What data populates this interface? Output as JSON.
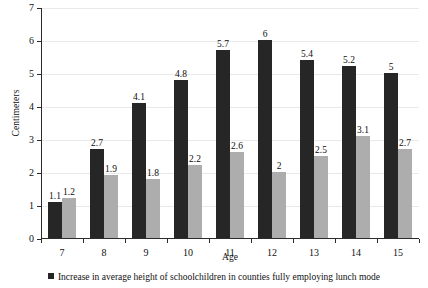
{
  "chart_data": {
    "type": "bar",
    "title": "",
    "subtitle": "",
    "xlabel": "Age",
    "ylabel": "Centimeters",
    "categories": [
      "7",
      "8",
      "9",
      "10",
      "11",
      "12",
      "13",
      "14",
      "15"
    ],
    "series": [
      {
        "name": "Increase in average height of schoolchildren in counties fully employing lunch mode",
        "color": "#262626",
        "values": [
          1.1,
          2.7,
          4.1,
          4.8,
          5.7,
          6,
          5.4,
          5.2,
          5
        ],
        "labels": [
          "1.1",
          "2.7",
          "4.1",
          "4.8",
          "5.7",
          "6",
          "5.4",
          "5.2",
          "5"
        ]
      },
      {
        "name": "",
        "color": "#adadad",
        "values": [
          1.2,
          1.9,
          1.8,
          2.2,
          2.6,
          2,
          2.5,
          3.1,
          2.7
        ],
        "labels": [
          "1.2",
          "1.9",
          "1.8",
          "2.2",
          "2.6",
          "2",
          "2.5",
          "3.1",
          "2.7"
        ]
      }
    ],
    "ylim": [
      0,
      7
    ],
    "yticks": [
      0,
      1,
      2,
      3,
      4,
      5,
      6,
      7
    ],
    "ytick_labels": [
      "0",
      "1",
      "2",
      "3",
      "4",
      "5",
      "6",
      "7"
    ],
    "grid": true,
    "grid_axis": "y",
    "legend_position": "bottom",
    "legend": [
      {
        "marker": "square",
        "color": "#262626",
        "label": "Increase in average height of schoolchildren in counties fully employing lunch mode"
      }
    ]
  }
}
